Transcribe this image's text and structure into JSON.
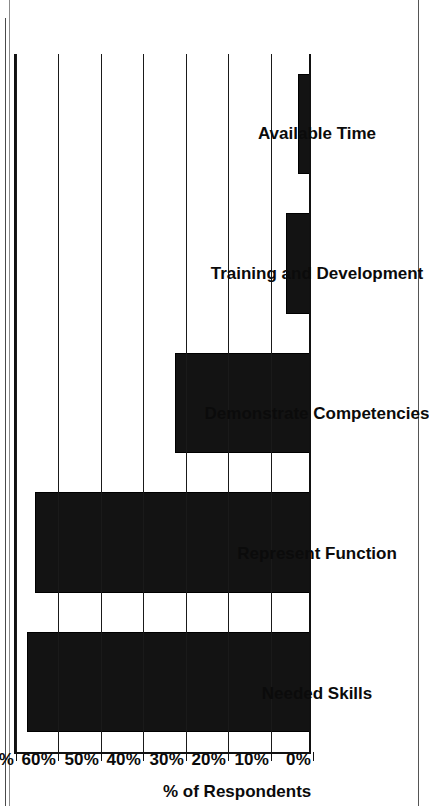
{
  "document": {
    "type": "scanned-figure",
    "orientation": "rotated-90-ccw",
    "background_color": "#ffffff",
    "ink_color": "#131313"
  },
  "chart_data": {
    "type": "bar",
    "orientation": "vertical-bars-rendered-sideways",
    "title": "",
    "subtitle": "",
    "xlabel": "",
    "ylabel": "% of Respondents",
    "categories": [
      "Needed Skills",
      "Represent Function",
      "Demonstrate Competencies",
      "Training and Development",
      "Available Time"
    ],
    "values": [
      67,
      65,
      32,
      6,
      3
    ],
    "ylim": [
      0,
      70
    ],
    "ytick_values": [
      0,
      10,
      20,
      30,
      40,
      50,
      60,
      70
    ],
    "ytick_labels": [
      "0%",
      "10%",
      "20%",
      "30%",
      "40%",
      "50%",
      "60%",
      "70%"
    ],
    "grid": true,
    "grid_axis": "value",
    "legend": false,
    "legend_position": "none",
    "bar_color": "#131313",
    "axis_color": "#111111"
  },
  "axis": {
    "value_axis_title": "% of Respondents"
  },
  "clipped_footer_text": "Demonstrate T"
}
